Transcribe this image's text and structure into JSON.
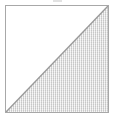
{
  "figure": {
    "type": "geometric-shape-diagram",
    "canvas": {
      "width_px": 115,
      "height_px": 114,
      "background_color": "#ffffff"
    },
    "box": {
      "left_px": 5,
      "top_px": 5,
      "width_px": 104,
      "height_px": 108,
      "border_color": "#a8a8a8",
      "border_width_px": 1,
      "fill_color": "#ffffff"
    },
    "diagonal": {
      "from": "top-right",
      "to": "bottom-left",
      "stroke_color": "#9a9a9a",
      "stroke_width_px": 1
    },
    "shaded_region": {
      "position": "lower-right",
      "shape": "triangle",
      "fill_color": "#e3e3e3",
      "pattern": "fine-stipple-hatch",
      "pattern_color": "#a0a0a0"
    },
    "unshaded_region": {
      "position": "upper-left",
      "shape": "triangle",
      "fill_color": "#ffffff"
    },
    "artifact": {
      "name": "cropped-edge-mark",
      "left_px": 53,
      "top_px": 0,
      "width_px": 9,
      "height_px": 2,
      "color": "#d8d8d8"
    }
  }
}
